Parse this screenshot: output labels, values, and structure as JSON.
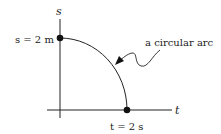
{
  "diagram": {
    "axes": {
      "vertical_label": "s",
      "horizontal_label": "t"
    },
    "points": {
      "s_intercept_label": "s = 2 m",
      "t_intercept_label": "t = 2 s"
    },
    "annotation": {
      "arc_label": "a circular arc"
    },
    "colors": {
      "stroke": "#222222",
      "background": "#ffffff"
    }
  }
}
